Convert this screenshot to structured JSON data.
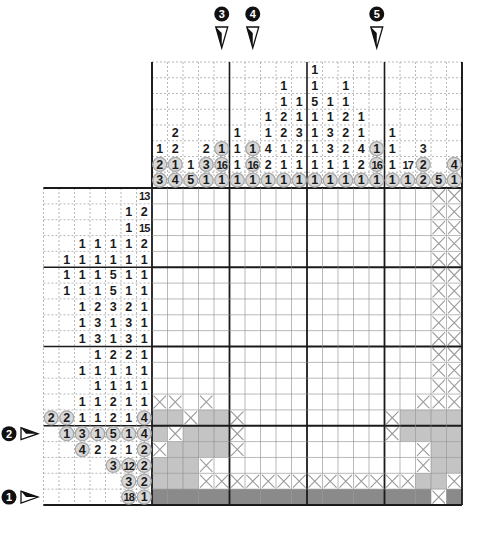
{
  "puzzle": {
    "type": "nonogram",
    "size": {
      "rows": 20,
      "cols": 20
    },
    "colors": {
      "filled_light": "#c4c4c4",
      "filled_dark": "#8a8a8a",
      "x_mark": "#9a9a9a",
      "grid_line": "#555555",
      "thick_line": "#1a1a1a",
      "circle_fill": "#d8d8d8"
    }
  },
  "markers": {
    "top": [
      {
        "label": "3",
        "col": 5
      },
      {
        "label": "4",
        "col": 7
      },
      {
        "label": "5",
        "col": 15
      }
    ],
    "left": [
      {
        "label": "2",
        "row": 16
      },
      {
        "label": "1",
        "row": 20
      }
    ]
  },
  "column_clues": [
    [
      {
        "v": "1"
      },
      {
        "v": "2",
        "c": true
      },
      {
        "v": "3",
        "c": true
      }
    ],
    [
      {
        "v": "2"
      },
      {
        "v": "2"
      },
      {
        "v": "1",
        "c": true
      },
      {
        "v": "4",
        "c": true
      }
    ],
    [
      {
        "v": "1"
      },
      {
        "v": "5",
        "c": true
      }
    ],
    [
      {
        "v": "2"
      },
      {
        "v": "3",
        "c": true
      },
      {
        "v": "1",
        "c": true
      }
    ],
    [
      {
        "v": "1",
        "c": true
      },
      {
        "v": "16",
        "c": true
      },
      {
        "v": "1",
        "c": true
      }
    ],
    [
      {
        "v": "1"
      },
      {
        "v": "1"
      },
      {
        "v": "1"
      },
      {
        "v": "1",
        "c": true
      }
    ],
    [
      {
        "v": "1",
        "c": true
      },
      {
        "v": "16",
        "c": true
      },
      {
        "v": "1",
        "c": true
      }
    ],
    [
      {
        "v": "1"
      },
      {
        "v": "1"
      },
      {
        "v": "4"
      },
      {
        "v": "2"
      },
      {
        "v": "1",
        "c": true
      }
    ],
    [
      {
        "v": "1"
      },
      {
        "v": "1"
      },
      {
        "v": "2"
      },
      {
        "v": "2"
      },
      {
        "v": "1"
      },
      {
        "v": "1"
      },
      {
        "v": "1",
        "c": true
      }
    ],
    [
      {
        "v": "1"
      },
      {
        "v": "1"
      },
      {
        "v": "3"
      },
      {
        "v": "2"
      },
      {
        "v": "1"
      },
      {
        "v": "1",
        "c": true
      }
    ],
    [
      {
        "v": "1"
      },
      {
        "v": "1"
      },
      {
        "v": "5"
      },
      {
        "v": "1"
      },
      {
        "v": "1"
      },
      {
        "v": "1"
      },
      {
        "v": "1"
      },
      {
        "v": "1",
        "c": true
      }
    ],
    [
      {
        "v": "1"
      },
      {
        "v": "1"
      },
      {
        "v": "3"
      },
      {
        "v": "3"
      },
      {
        "v": "1"
      },
      {
        "v": "1",
        "c": true
      }
    ],
    [
      {
        "v": "1"
      },
      {
        "v": "1"
      },
      {
        "v": "2"
      },
      {
        "v": "2"
      },
      {
        "v": "2"
      },
      {
        "v": "1"
      },
      {
        "v": "1",
        "c": true
      }
    ],
    [
      {
        "v": "1"
      },
      {
        "v": "1"
      },
      {
        "v": "4"
      },
      {
        "v": "2"
      },
      {
        "v": "1",
        "c": true
      }
    ],
    [
      {
        "v": "1",
        "c": true
      },
      {
        "v": "16",
        "c": true
      },
      {
        "v": "1",
        "c": true
      }
    ],
    [
      {
        "v": "1"
      },
      {
        "v": "1"
      },
      {
        "v": "1"
      },
      {
        "v": "1",
        "c": true
      }
    ],
    [
      {
        "v": "17"
      },
      {
        "v": "1",
        "c": true
      }
    ],
    [
      {
        "v": "3"
      },
      {
        "v": "2",
        "c": true
      },
      {
        "v": "2",
        "c": true
      }
    ],
    [
      {
        "v": "5",
        "c": true
      }
    ],
    [
      {
        "v": "4",
        "c": true
      },
      {
        "v": "1",
        "c": true
      }
    ]
  ],
  "row_clues": [
    [
      {
        "v": "13"
      }
    ],
    [
      {
        "v": "1"
      },
      {
        "v": "2"
      }
    ],
    [
      {
        "v": "1"
      },
      {
        "v": "15"
      }
    ],
    [
      {
        "v": "1"
      },
      {
        "v": "1"
      },
      {
        "v": "1"
      },
      {
        "v": "1"
      },
      {
        "v": "2"
      }
    ],
    [
      {
        "v": "1"
      },
      {
        "v": "1"
      },
      {
        "v": "1"
      },
      {
        "v": "1"
      },
      {
        "v": "1"
      },
      {
        "v": "1"
      }
    ],
    [
      {
        "v": "1"
      },
      {
        "v": "1"
      },
      {
        "v": "1"
      },
      {
        "v": "5"
      },
      {
        "v": "1"
      },
      {
        "v": "1"
      }
    ],
    [
      {
        "v": "1"
      },
      {
        "v": "1"
      },
      {
        "v": "1"
      },
      {
        "v": "5"
      },
      {
        "v": "1"
      },
      {
        "v": "1"
      }
    ],
    [
      {
        "v": "1"
      },
      {
        "v": "2"
      },
      {
        "v": "3"
      },
      {
        "v": "2"
      },
      {
        "v": "1"
      }
    ],
    [
      {
        "v": "1"
      },
      {
        "v": "3"
      },
      {
        "v": "1"
      },
      {
        "v": "3"
      },
      {
        "v": "1"
      }
    ],
    [
      {
        "v": "1"
      },
      {
        "v": "3"
      },
      {
        "v": "1"
      },
      {
        "v": "3"
      },
      {
        "v": "1"
      }
    ],
    [
      {
        "v": "1"
      },
      {
        "v": "2"
      },
      {
        "v": "2"
      },
      {
        "v": "1"
      }
    ],
    [
      {
        "v": "1"
      },
      {
        "v": "1"
      },
      {
        "v": "1"
      },
      {
        "v": "1"
      },
      {
        "v": "1"
      }
    ],
    [
      {
        "v": "1"
      },
      {
        "v": "1"
      },
      {
        "v": "1"
      },
      {
        "v": "1"
      }
    ],
    [
      {
        "v": "1"
      },
      {
        "v": "1"
      },
      {
        "v": "2"
      },
      {
        "v": "1"
      },
      {
        "v": "1"
      }
    ],
    [
      {
        "v": "2",
        "c": true
      },
      {
        "v": "2",
        "c": true
      },
      {
        "v": "1"
      },
      {
        "v": "1"
      },
      {
        "v": "2"
      },
      {
        "v": "1"
      },
      {
        "v": "4",
        "c": true
      }
    ],
    [
      {
        "v": "1",
        "c": true
      },
      {
        "v": "3",
        "c": true
      },
      {
        "v": "1",
        "c": true
      },
      {
        "v": "5",
        "c": true
      },
      {
        "v": "1",
        "c": true
      },
      {
        "v": "4",
        "c": true
      }
    ],
    [
      {
        "v": "4",
        "c": true
      },
      {
        "v": "2"
      },
      {
        "v": "2"
      },
      {
        "v": "1"
      },
      {
        "v": "2",
        "c": true
      }
    ],
    [
      {
        "v": "3",
        "c": true
      },
      {
        "v": "12",
        "c": true
      },
      {
        "v": "2",
        "c": true
      }
    ],
    [
      {
        "v": "3",
        "c": true
      },
      {
        "v": "2",
        "c": true
      }
    ],
    [
      {
        "v": "18",
        "c": true
      },
      {
        "v": "1",
        "c": true
      }
    ]
  ],
  "grid_state_legend": {
    ".": "empty",
    "#": "filled",
    "D": "filled-dark",
    "x": "crossed-out"
  },
  "grid_state": [
    "..................xx",
    "..................xx",
    "..................xx",
    "..................xx",
    "..................xx",
    "..................xx",
    "..................xx",
    "..................xx",
    "..................xx",
    "..................xx",
    "..................xx",
    "..................xx",
    "..................xx",
    "xx.x.............xxx",
    "##x##x.........x####",
    "#x###x.........x####",
    "x####x...........x##",
    "###x.............x##",
    "###xxxxxxxxxxxxxx##x",
    "DDDDDDDDDDDDDDDDDDxD"
  ]
}
